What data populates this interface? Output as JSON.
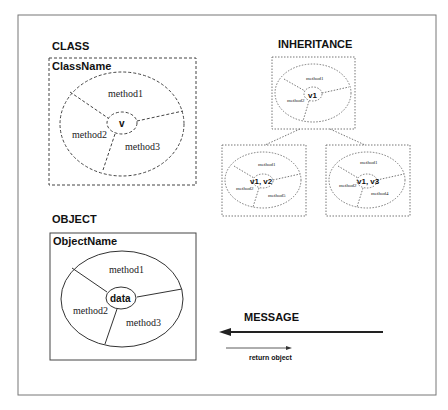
{
  "class_section": {
    "title": "CLASS",
    "box_label": "ClassName",
    "center": "v",
    "methods": [
      "method1",
      "method2",
      "method3"
    ]
  },
  "inheritance_section": {
    "title": "INHERITANCE",
    "parent": {
      "center": "v1",
      "methods": [
        "method1",
        "method2"
      ]
    },
    "children": [
      {
        "center": "v1, v2",
        "methods": [
          "method1",
          "method2",
          "method5"
        ]
      },
      {
        "center": "v1, v3",
        "methods": [
          "method1",
          "method2",
          "method4"
        ]
      }
    ]
  },
  "object_section": {
    "title": "OBJECT",
    "box_label": "ObjectName",
    "center": "data",
    "methods": [
      "method1",
      "method2",
      "method3"
    ]
  },
  "message_section": {
    "title": "MESSAGE",
    "return_label": "return object"
  },
  "colors": {
    "stroke": "#333333",
    "dashed": "#555555",
    "background": "#ffffff"
  }
}
